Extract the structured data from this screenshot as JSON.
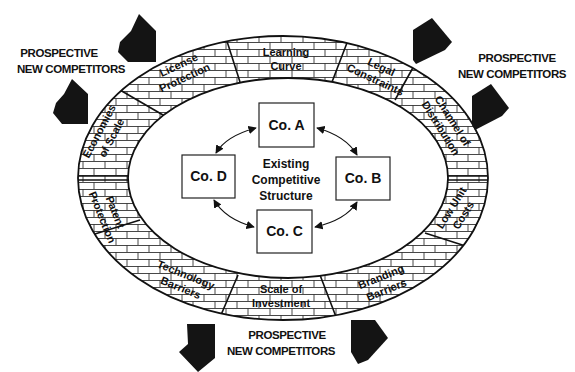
{
  "diagram": {
    "center_label": [
      "Existing",
      "Competitive",
      "Structure"
    ],
    "companies": [
      {
        "id": "a",
        "label": "Co. A"
      },
      {
        "id": "b",
        "label": "Co. B"
      },
      {
        "id": "c",
        "label": "Co. C"
      },
      {
        "id": "d",
        "label": "Co. D"
      }
    ],
    "barriers": [
      {
        "id": "learning-curve",
        "lines": [
          "Learning",
          "Curve"
        ]
      },
      {
        "id": "legal-constraints",
        "lines": [
          "Legal",
          "Constraints"
        ]
      },
      {
        "id": "channel-of-distribution",
        "lines": [
          "Channel of",
          "Distribution"
        ]
      },
      {
        "id": "low-unit-costs",
        "lines": [
          "Low Unit",
          "Costs"
        ]
      },
      {
        "id": "branding-barriers",
        "lines": [
          "Branding",
          "Barriers"
        ]
      },
      {
        "id": "scale-of-investment",
        "lines": [
          "Scale of",
          "Investment"
        ]
      },
      {
        "id": "technology-barriers",
        "lines": [
          "Technology",
          "Barriers"
        ]
      },
      {
        "id": "patent-protection",
        "lines": [
          "Patent",
          "Protection"
        ]
      },
      {
        "id": "economies-of-scale",
        "lines": [
          "Economies",
          "of Scale"
        ]
      },
      {
        "id": "license-protection",
        "lines": [
          "License",
          "Protection"
        ]
      }
    ],
    "entrant_labels": [
      {
        "id": "top-left",
        "lines": [
          "PROSPECTIVE",
          "NEW COMPETITORS"
        ]
      },
      {
        "id": "top-right",
        "lines": [
          "PROSPECTIVE",
          "NEW COMPETITORS"
        ]
      },
      {
        "id": "bottom",
        "lines": [
          "PROSPECTIVE",
          "NEW COMPETITORS"
        ]
      }
    ],
    "colors": {
      "ink": "#111111",
      "background": "#ffffff",
      "arrow": "#141414"
    }
  }
}
